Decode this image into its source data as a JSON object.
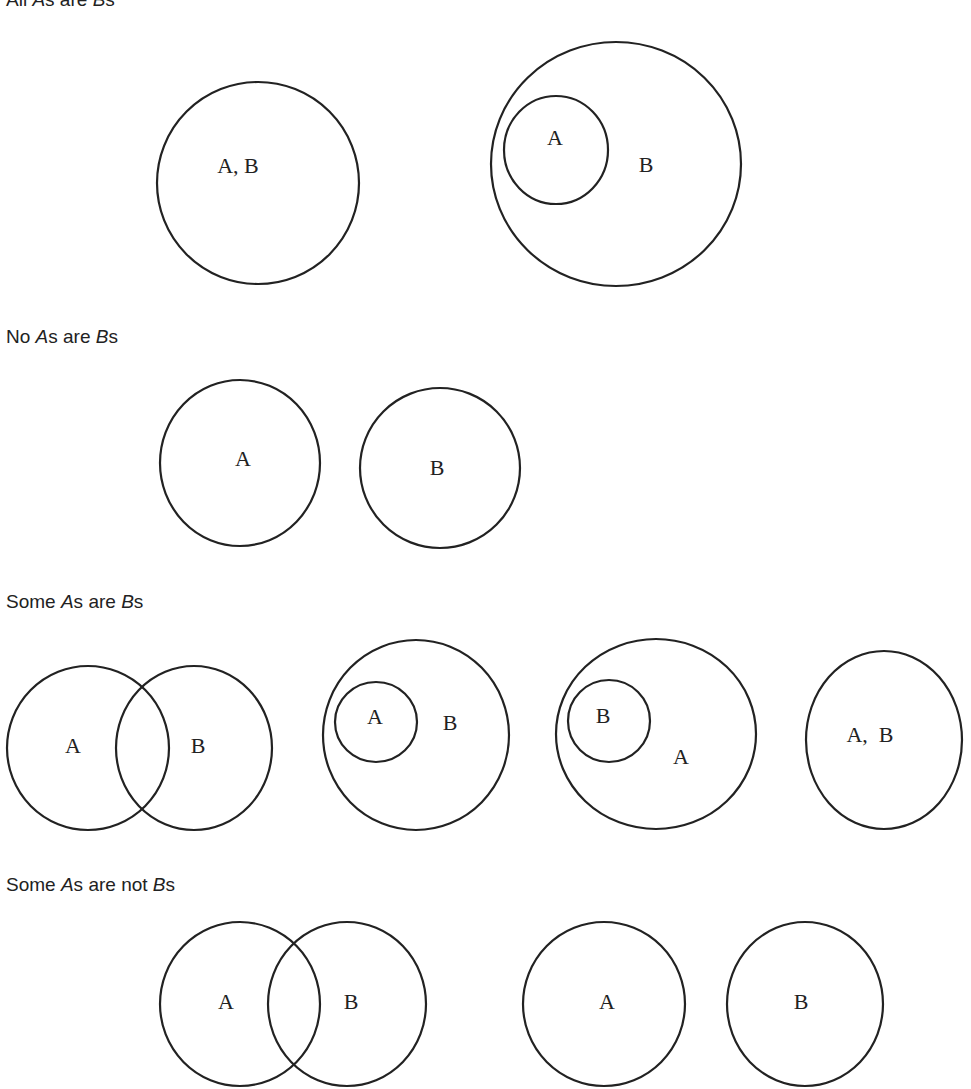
{
  "sections": [
    {
      "id": "all",
      "heading": {
        "pre": "All ",
        "a": "A",
        "mid": "s are ",
        "b": "B",
        "post": "s"
      },
      "heading_y": -10,
      "diagrams": [
        {
          "shapes": [
            {
              "cx": 258,
              "cy": 183,
              "rx": 101,
              "ry": 101
            }
          ],
          "labels": [
            {
              "text": "A, B",
              "x": 238,
              "y": 168
            }
          ]
        },
        {
          "shapes": [
            {
              "cx": 616,
              "cy": 164,
              "rx": 125,
              "ry": 122
            },
            {
              "cx": 556,
              "cy": 150,
              "rx": 52,
              "ry": 54
            }
          ],
          "labels": [
            {
              "text": "A",
              "x": 555,
              "y": 140
            },
            {
              "text": "B",
              "x": 646,
              "y": 167
            }
          ]
        }
      ]
    },
    {
      "id": "no",
      "heading": {
        "pre": "No ",
        "a": "A",
        "mid": "s are ",
        "b": "B",
        "post": "s"
      },
      "heading_y": 327,
      "diagrams": [
        {
          "shapes": [
            {
              "cx": 240,
              "cy": 463,
              "rx": 80,
              "ry": 83
            }
          ],
          "labels": [
            {
              "text": "A",
              "x": 243,
              "y": 461
            }
          ]
        },
        {
          "shapes": [
            {
              "cx": 440,
              "cy": 468,
              "rx": 80,
              "ry": 80
            }
          ],
          "labels": [
            {
              "text": "B",
              "x": 437,
              "y": 470
            }
          ]
        }
      ]
    },
    {
      "id": "some",
      "heading": {
        "pre": "Some ",
        "a": "A",
        "mid": "s are ",
        "b": "B",
        "post": "s"
      },
      "heading_y": 592,
      "diagrams": [
        {
          "shapes": [
            {
              "cx": 88,
              "cy": 748,
              "rx": 81,
              "ry": 82
            },
            {
              "cx": 194,
              "cy": 748,
              "rx": 78,
              "ry": 82
            }
          ],
          "labels": [
            {
              "text": "A",
              "x": 73,
              "y": 748
            },
            {
              "text": "B",
              "x": 198,
              "y": 748
            }
          ]
        },
        {
          "shapes": [
            {
              "cx": 416,
              "cy": 735,
              "rx": 93,
              "ry": 95
            },
            {
              "cx": 376,
              "cy": 722,
              "rx": 41,
              "ry": 40
            }
          ],
          "labels": [
            {
              "text": "A",
              "x": 375,
              "y": 719
            },
            {
              "text": "B",
              "x": 450,
              "y": 725
            }
          ]
        },
        {
          "shapes": [
            {
              "cx": 656,
              "cy": 734,
              "rx": 100,
              "ry": 95
            },
            {
              "cx": 609,
              "cy": 721,
              "rx": 41,
              "ry": 41
            }
          ],
          "labels": [
            {
              "text": "B",
              "x": 603,
              "y": 718
            },
            {
              "text": "A",
              "x": 681,
              "y": 759
            }
          ]
        },
        {
          "shapes": [
            {
              "cx": 884,
              "cy": 740,
              "rx": 78,
              "ry": 89
            }
          ],
          "labels": [
            {
              "text": "A,  B",
              "x": 870,
              "y": 737
            }
          ]
        }
      ]
    },
    {
      "id": "some-not",
      "heading": {
        "pre": "Some ",
        "a": "A",
        "mid": "s are not ",
        "b": "B",
        "post": "s"
      },
      "heading_y": 875,
      "diagrams": [
        {
          "shapes": [
            {
              "cx": 240,
              "cy": 1004,
              "rx": 80,
              "ry": 82
            },
            {
              "cx": 347,
              "cy": 1004,
              "rx": 79,
              "ry": 82
            }
          ],
          "labels": [
            {
              "text": "A",
              "x": 226,
              "y": 1004
            },
            {
              "text": "B",
              "x": 351,
              "y": 1004
            }
          ]
        },
        {
          "shapes": [
            {
              "cx": 604,
              "cy": 1004,
              "rx": 81,
              "ry": 82
            }
          ],
          "labels": [
            {
              "text": "A",
              "x": 607,
              "y": 1004
            }
          ]
        },
        {
          "shapes": [
            {
              "cx": 805,
              "cy": 1004,
              "rx": 78,
              "ry": 82
            }
          ],
          "labels": [
            {
              "text": "B",
              "x": 801,
              "y": 1004
            }
          ]
        }
      ]
    }
  ]
}
